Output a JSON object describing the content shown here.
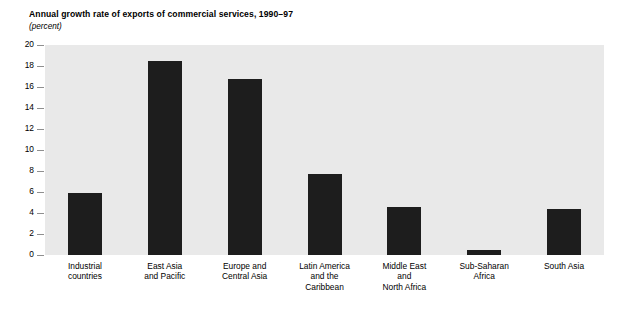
{
  "chart_data": {
    "type": "bar",
    "title": "Annual growth rate of exports of commercial services, 1990–97",
    "subtitle": "(percent)",
    "xlabel": "",
    "ylabel": "",
    "ylim": [
      0,
      20
    ],
    "ytick_step": 2,
    "yticks": [
      20,
      18,
      16,
      14,
      12,
      10,
      8,
      6,
      4,
      2,
      0
    ],
    "ytick_labels": [
      "20",
      "18",
      "16",
      "14",
      "12",
      "10",
      "8",
      "6",
      "4",
      "2",
      "0"
    ],
    "grid": false,
    "legend": "none",
    "categories": [
      "Industrial\ncountries",
      "East Asia\nand Pacific",
      "Europe and\nCentral Asia",
      "Latin America\nand the\nCaribbean",
      "Middle East\nand\nNorth Africa",
      "Sub-Saharan\nAfrica",
      "South Asia"
    ],
    "values": [
      5.9,
      18.5,
      16.8,
      7.7,
      4.6,
      0.5,
      4.4
    ],
    "bar_color": "#1d1d1d",
    "plot_background": "#e9e9e9",
    "page_background": "#ffffff"
  }
}
